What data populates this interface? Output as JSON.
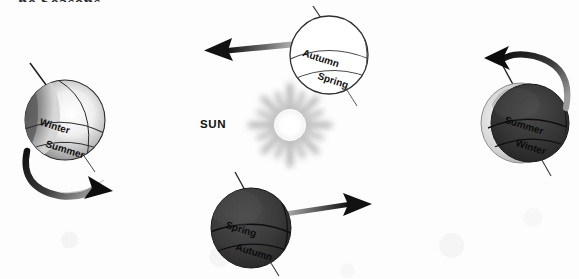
{
  "diagram": {
    "title_fragment": "he Seasons",
    "sun": {
      "label": "SUN",
      "color": "#ffffff",
      "ray_color": "#9a9a9a"
    },
    "globes": [
      {
        "id": "left",
        "name": "globe-left",
        "north_label": "Winter",
        "south_label": "Summer",
        "shading": "light",
        "rotation_arrow": "clockwise-below",
        "fill_color": "#d8d8d8"
      },
      {
        "id": "top",
        "name": "globe-top",
        "north_label": "Autumn",
        "south_label": "Spring",
        "shading": "outline",
        "rotation_arrow": "none",
        "fill_color": "#ffffff"
      },
      {
        "id": "bottom",
        "name": "globe-bottom",
        "north_label": "Spring",
        "south_label": "Autumn",
        "shading": "dark",
        "rotation_arrow": "none",
        "fill_color": "#3a3a3a"
      },
      {
        "id": "right",
        "name": "globe-right",
        "north_label": "Summer",
        "south_label": "Winter",
        "shading": "dark",
        "rotation_arrow": "counterclockwise-above",
        "fill_color": "#333333"
      }
    ],
    "orbit_arrows": [
      {
        "id": "top-arrow",
        "direction": "left",
        "color": "#1a1a1a"
      },
      {
        "id": "bottom-arrow",
        "direction": "right",
        "color": "#1a1a1a"
      }
    ]
  }
}
